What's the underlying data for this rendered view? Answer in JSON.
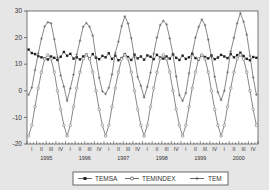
{
  "chart_data": {
    "type": "line",
    "title": "",
    "xlabel": "",
    "ylabel": "",
    "ylim": [
      -20,
      30
    ],
    "yticks": [
      -20,
      -10,
      0,
      10,
      20,
      30
    ],
    "ytick_labels": [
      "-20",
      "-10",
      "0",
      "10",
      "20",
      "30"
    ],
    "years": [
      "1995",
      "1996",
      "1997",
      "1998",
      "1999",
      "2000"
    ],
    "quarter_labels": [
      "I",
      "II",
      "III",
      "IV"
    ],
    "frequency": "monthly",
    "start": "1995M01",
    "end": "2000M12",
    "grid": false,
    "legend_position": "bottom",
    "series": [
      {
        "name": "TEMSA",
        "marker": "filled-square",
        "values": [
          15.5,
          14.2,
          13.8,
          13.0,
          12.6,
          12.2,
          11.8,
          12.9,
          12.4,
          11.6,
          12.8,
          14.6,
          13.2,
          13.9,
          12.1,
          12.6,
          11.8,
          12.9,
          13.6,
          12.1,
          13.8,
          12.4,
          11.9,
          13.1,
          12.6,
          14.1,
          12.0,
          13.2,
          11.5,
          12.3,
          13.8,
          12.7,
          11.6,
          13.6,
          12.2,
          12.9,
          11.7,
          13.3,
          12.8,
          11.9,
          13.5,
          12.5,
          12.1,
          12.9,
          12.1,
          13.7,
          12.4,
          11.6,
          13.2,
          12.0,
          12.6,
          13.9,
          12.3,
          11.8,
          13.4,
          12.7,
          12.2,
          13.3,
          11.9,
          12.5,
          13.5,
          12.9,
          12.3,
          13.8,
          12.6,
          13.4,
          14.3,
          13.1,
          12.0,
          11.5,
          12.7,
          12.4
        ]
      },
      {
        "name": "TEMINDEX",
        "marker": "open-circle",
        "values": [
          -17.0,
          -13.0,
          -6.0,
          1.0,
          7.0,
          12.0,
          13.5,
          12.0,
          7.0,
          0.0,
          -7.0,
          -13.0,
          -17.0,
          -13.0,
          -6.0,
          1.0,
          7.0,
          12.0,
          13.5,
          12.0,
          7.0,
          0.0,
          -7.0,
          -13.0,
          -17.0,
          -13.0,
          -6.0,
          1.0,
          7.0,
          12.0,
          13.5,
          12.0,
          7.0,
          0.0,
          -7.0,
          -13.0,
          -17.0,
          -13.0,
          -6.0,
          1.0,
          7.0,
          12.0,
          13.5,
          12.0,
          7.0,
          0.0,
          -7.0,
          -13.0,
          -17.0,
          -13.0,
          -6.0,
          1.0,
          7.0,
          12.0,
          13.5,
          12.0,
          7.0,
          0.0,
          -7.0,
          -13.0,
          -17.0,
          -13.0,
          -6.0,
          1.0,
          7.0,
          12.0,
          13.5,
          12.0,
          7.0,
          0.0,
          -7.0,
          -13.0
        ]
      },
      {
        "name": "TEM",
        "marker": "plus",
        "values": [
          -1.5,
          1.2,
          7.8,
          14.0,
          19.6,
          24.2,
          25.8,
          25.4,
          19.4,
          12.6,
          5.8,
          1.6,
          -3.8,
          0.9,
          6.1,
          13.6,
          18.8,
          24.1,
          25.5,
          24.1,
          20.8,
          12.6,
          4.9,
          -0.2,
          -1.2,
          1.1,
          6.2,
          14.2,
          18.5,
          24.3,
          28.0,
          25.3,
          19.8,
          12.6,
          5.2,
          1.9,
          -2.5,
          1.5,
          6.8,
          13.9,
          20.0,
          24.7,
          26.3,
          25.0,
          19.7,
          13.7,
          5.4,
          -1.6,
          -3.8,
          -0.9,
          6.6,
          14.1,
          20.0,
          24.0,
          26.8,
          24.7,
          19.2,
          12.7,
          5.3,
          -0.5,
          -3.5,
          0.0,
          7.0,
          14.8,
          19.9,
          25.4,
          29.2,
          26.0,
          21.1,
          13.1,
          5.0,
          -1.5
        ]
      }
    ]
  },
  "legend": {
    "items": [
      {
        "label": "TEMSA",
        "marker": "filled-square"
      },
      {
        "label": "TEMINDEX",
        "marker": "open-circle"
      },
      {
        "label": "TEM",
        "marker": "plus"
      }
    ]
  },
  "colors": {
    "background": "#e6e6e6",
    "plot_bg": "#ffffff",
    "line": "#555555",
    "axis": "#444444",
    "text": "#333333"
  }
}
